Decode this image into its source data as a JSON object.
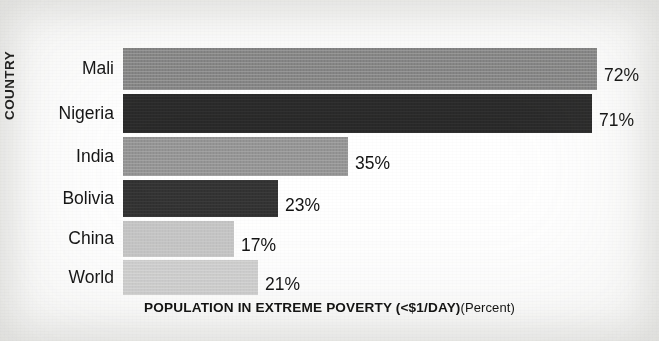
{
  "chart_data": {
    "type": "bar",
    "orientation": "horizontal",
    "title": "",
    "xlabel": "POPULATION IN EXTREME POVERTY (<$1/DAY)",
    "xlabel_unit": "(Percent)",
    "ylabel": "COUNTRY",
    "grid": false,
    "legend": "none",
    "xlim": [
      0,
      72
    ],
    "categories": [
      "Mali",
      "Nigeria",
      "India",
      "Bolivia",
      "China",
      "World"
    ],
    "values": [
      72,
      71,
      35,
      23,
      17,
      21
    ],
    "value_labels": [
      "72%",
      "71%",
      "35%",
      "23%",
      "17%",
      "21%"
    ],
    "bars": [
      {
        "category": "Mali",
        "value": 72,
        "label": "72%",
        "color": "#878787",
        "bar_left": 123,
        "bar_right": 597,
        "top": 48,
        "height": 42
      },
      {
        "category": "Nigeria",
        "value": 71,
        "label": "71%",
        "color": "#2a2a2a",
        "bar_left": 123,
        "bar_right": 592,
        "top": 94,
        "height": 39
      },
      {
        "category": "India",
        "value": 35,
        "label": "35%",
        "color": "#959595",
        "bar_left": 123,
        "bar_right": 348,
        "top": 137,
        "height": 39
      },
      {
        "category": "Bolivia",
        "value": 23,
        "label": "23%",
        "color": "#333333",
        "bar_left": 123,
        "bar_right": 278,
        "top": 180,
        "height": 37
      },
      {
        "category": "China",
        "value": 17,
        "label": "17%",
        "color": "#c5c5c5",
        "bar_left": 123,
        "bar_right": 234,
        "top": 221,
        "height": 36
      },
      {
        "category": "World",
        "value": 21,
        "label": "21%",
        "color": "#cfcfcf",
        "bar_left": 123,
        "bar_right": 258,
        "top": 260,
        "height": 35
      }
    ]
  },
  "colors": {
    "background": "#ffffff",
    "text": "#131313",
    "bar_dark": "#2a2a2a",
    "bar_mid": "#8d8d8d",
    "bar_light": "#cacaca"
  }
}
